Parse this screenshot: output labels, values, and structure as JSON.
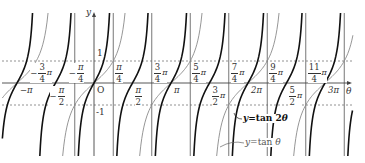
{
  "chart_data": {
    "type": "line",
    "title": "",
    "xlabel": "θ",
    "ylabel": "y",
    "origin_label": "O",
    "x_unit": "π",
    "xlim": [
      -1.2,
      3.3
    ],
    "ylim": [
      -3.2,
      3.2
    ],
    "y_ticks": [
      {
        "value": 1,
        "label": "1"
      },
      {
        "value": -1,
        "label": "-1"
      }
    ],
    "dashed_lines": [
      1,
      -1
    ],
    "asymptote_lines": [
      -0.25,
      0.25,
      0.75,
      1.25,
      1.75,
      2.25,
      2.75,
      3.25
    ],
    "x_tick_labels_above": [
      {
        "value": -0.75,
        "sign": "−",
        "num": "3",
        "den": "4",
        "pi": "π"
      },
      {
        "value": -0.25,
        "sign": "−",
        "num": "π",
        "den": "4",
        "pi": ""
      },
      {
        "value": 0.25,
        "sign": "",
        "num": "π",
        "den": "4",
        "pi": ""
      },
      {
        "value": 0.75,
        "sign": "",
        "num": "3",
        "den": "4",
        "pi": "π"
      },
      {
        "value": 1.25,
        "sign": "",
        "num": "5",
        "den": "4",
        "pi": "π"
      },
      {
        "value": 1.75,
        "sign": "",
        "num": "7",
        "den": "4",
        "pi": "π"
      },
      {
        "value": 2.25,
        "sign": "",
        "num": "9",
        "den": "4",
        "pi": "π"
      },
      {
        "value": 2.75,
        "sign": "",
        "num": "11",
        "den": "4",
        "pi": "π"
      }
    ],
    "x_tick_labels_below": [
      {
        "value": -1,
        "label": "−π",
        "type": "plain"
      },
      {
        "value": -0.5,
        "sign": "−",
        "num": "π",
        "den": "2",
        "pi": "",
        "type": "frac"
      },
      {
        "value": 0.5,
        "sign": "",
        "num": "π",
        "den": "2",
        "pi": "",
        "type": "frac"
      },
      {
        "value": 1,
        "label": "π",
        "type": "plain"
      },
      {
        "value": 1.5,
        "sign": "",
        "num": "3",
        "den": "2",
        "pi": "π",
        "type": "frac"
      },
      {
        "value": 2,
        "label": "2π",
        "type": "plain"
      },
      {
        "value": 2.5,
        "sign": "",
        "num": "5",
        "den": "2",
        "pi": "π",
        "type": "frac"
      },
      {
        "value": 3,
        "label": "3π",
        "type": "plain"
      }
    ],
    "series": [
      {
        "name": "y=tan 2θ",
        "function": "tan(2θ)",
        "period_in_pi": 0.5,
        "color": "#111111",
        "width": 1.6
      },
      {
        "name": "y=tan θ",
        "function": "tan(θ)",
        "period_in_pi": 1,
        "color": "#8a8a8a",
        "width": 0.9
      }
    ],
    "legend": [
      {
        "label_pre": "y",
        "label_post": "=tan 2",
        "var": "θ",
        "style": "bold"
      },
      {
        "label_pre": "y",
        "label_post": "=tan ",
        "var": "θ",
        "style": "gray"
      }
    ]
  },
  "layout": {
    "origin_x": 94,
    "origin_y": 83,
    "px_per_pi": 77,
    "px_per_unit_y": 22,
    "plot_left": 2,
    "plot_right": 353,
    "plot_top": 13,
    "plot_bottom": 156
  },
  "colors": {
    "axis": "#444444",
    "grid_line": "#666666",
    "dashed": "#777777",
    "tan2": "#111111",
    "tan1": "#8a8a8a"
  }
}
